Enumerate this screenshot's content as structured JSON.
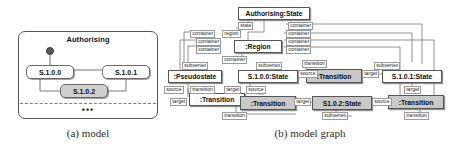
{
  "figure": {
    "captions": [
      {
        "id": "model",
        "text": "(a) model"
      },
      {
        "id": "model-graph",
        "text": "(b) model graph"
      }
    ]
  },
  "model_panel": {
    "title": "Authorising",
    "states": [
      {
        "id": "s1000",
        "label": "S.1.0.0",
        "shaded": false
      },
      {
        "id": "s1001",
        "label": "S.1.0.1",
        "shaded": false
      },
      {
        "id": "s1002",
        "label": "S.1.0.2",
        "shaded": true
      }
    ],
    "ellipsis": "•••"
  },
  "graph_panel": {
    "nodes": [
      {
        "id": "n-authorising",
        "label": "Authorising:State",
        "shaded": false
      },
      {
        "id": "n-region",
        "label": ":Region",
        "shaded": false
      },
      {
        "id": "n-pseudostate",
        "label": ":Pseudostate",
        "shaded": false
      },
      {
        "id": "n-s1000",
        "label": "S.1.0.0:State",
        "shaded": false
      },
      {
        "id": "n-trans-top",
        "label": ":Transition",
        "shaded": true
      },
      {
        "id": "n-s1001",
        "label": "S.1.0.1:State",
        "shaded": false
      },
      {
        "id": "n-trans-left",
        "label": ":Transition",
        "shaded": false
      },
      {
        "id": "n-trans-mid",
        "label": ":Transition",
        "shaded": true
      },
      {
        "id": "n-s1002",
        "label": "S1.0.2:State",
        "shaded": true
      },
      {
        "id": "n-trans-right",
        "label": ":Transition",
        "shaded": true
      }
    ],
    "edge_labels": [
      {
        "id": "el-state",
        "text": "state"
      },
      {
        "id": "el-container-top",
        "text": "container"
      },
      {
        "id": "el-container-l1",
        "text": "container"
      },
      {
        "id": "el-region",
        "text": "region"
      },
      {
        "id": "el-container-r1",
        "text": "container"
      },
      {
        "id": "el-container-l2",
        "text": "container"
      },
      {
        "id": "el-container-r2",
        "text": "container"
      },
      {
        "id": "el-container-l3",
        "text": "container"
      },
      {
        "id": "el-container-r3",
        "text": "container"
      },
      {
        "id": "el-container-mid",
        "text": "container"
      },
      {
        "id": "el-subvertex-ps",
        "text": "subvertex"
      },
      {
        "id": "el-subvertex-s1000",
        "text": "subvertex"
      },
      {
        "id": "el-transition-top",
        "text": "transition"
      },
      {
        "id": "el-subvertex-s1001",
        "text": "subvertex"
      },
      {
        "id": "el-source-ps",
        "text": "source"
      },
      {
        "id": "el-transition-l",
        "text": "transition"
      },
      {
        "id": "el-target-l",
        "text": "target"
      },
      {
        "id": "el-source-s1000a",
        "text": "source"
      },
      {
        "id": "el-source-s1000b",
        "text": "source"
      },
      {
        "id": "el-target-top",
        "text": "target"
      },
      {
        "id": "el-target-mid",
        "text": "target"
      },
      {
        "id": "el-target-right",
        "text": "target"
      },
      {
        "id": "el-source-s1002",
        "text": "source"
      },
      {
        "id": "el-target-left2",
        "text": "target"
      },
      {
        "id": "el-transition-bottom",
        "text": "transition"
      },
      {
        "id": "el-subvertex-bottom",
        "text": "subvertex"
      },
      {
        "id": "el-transition-br",
        "text": "transition"
      }
    ]
  }
}
